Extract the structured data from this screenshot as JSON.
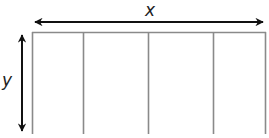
{
  "diagram": {
    "type": "dimension-diagram",
    "labels": {
      "width": "x",
      "height": "y"
    },
    "shape": {
      "description": "open-bottom rectangle divided into 4 sections by vertical lines",
      "sections": 4,
      "top_edge_y": 32,
      "bottom_y": 133,
      "vertical_lines_x": [
        32,
        83,
        148,
        213,
        265
      ]
    },
    "arrows": {
      "horizontal": {
        "label": "x",
        "from_x": 33,
        "to_x": 265,
        "y": 22,
        "double_headed": true
      },
      "vertical": {
        "label": "y",
        "from_y": 33,
        "to_y": 133,
        "x": 22,
        "double_headed": true
      }
    },
    "colors": {
      "frame_lines": "#8a8a8a",
      "arrows": "#111111",
      "label_text": "#222222",
      "background": "#ffffff"
    }
  }
}
